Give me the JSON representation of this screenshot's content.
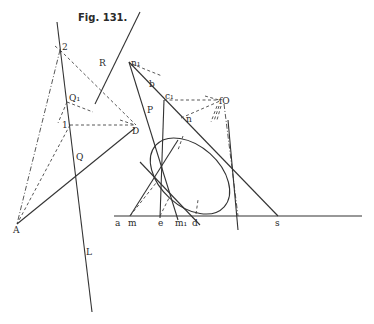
{
  "figure": {
    "title": "Fig. 131.",
    "labels": {
      "two": "2",
      "one": "1",
      "R": "R",
      "Q1": "Q₁",
      "Q": "Q",
      "D": "D",
      "A": "A",
      "L": "L",
      "n1": "n₁",
      "b": "b",
      "c1": "c₁",
      "P": "P",
      "n": "n",
      "O": "fO",
      "a": "a",
      "m": "m",
      "e": "e",
      "m1": "m₁",
      "d": "d",
      "s": "s"
    },
    "colors": {
      "ink": "#333333",
      "paper": "#ffffff"
    }
  }
}
